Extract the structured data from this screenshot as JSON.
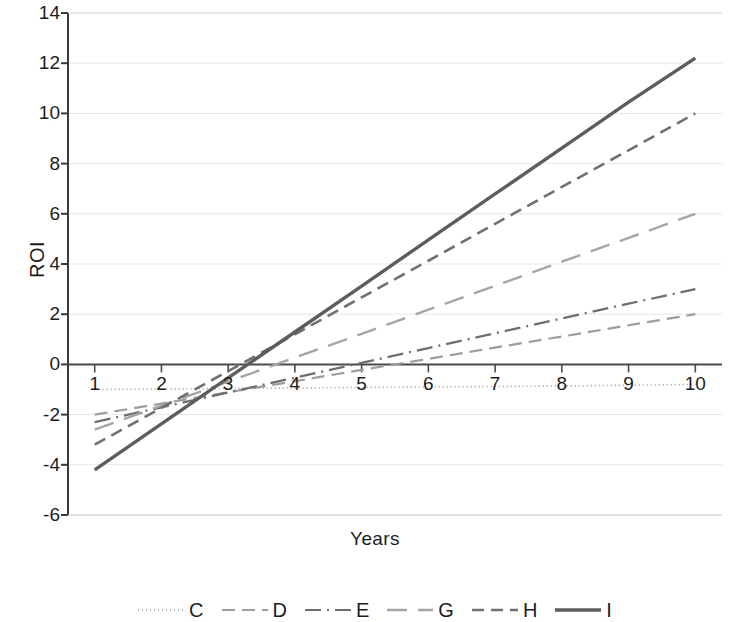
{
  "chart_data": {
    "type": "line",
    "title": "",
    "xlabel": "Years",
    "ylabel": "ROI",
    "x": [
      1,
      2,
      3,
      4,
      5,
      6,
      7,
      8,
      9,
      10
    ],
    "xlim": [
      0.6,
      10.4
    ],
    "ylim": [
      -6,
      14
    ],
    "xticks": [
      "1",
      "2",
      "3",
      "4",
      "5",
      "6",
      "7",
      "8",
      "9",
      "10"
    ],
    "yticks": [
      "14",
      "12",
      "10",
      "8",
      "6",
      "4",
      "2",
      "0",
      "-2",
      "-4",
      "-6"
    ],
    "grid": true,
    "grid_axis": "y",
    "zero_line": true,
    "legend_position": "bottom",
    "series": [
      {
        "name": "C",
        "style": "dotted",
        "color": "#9a9a9a",
        "width": 1.6,
        "dash": "1,3",
        "values": [
          -1.0,
          -0.98,
          -0.96,
          -0.94,
          -0.92,
          -0.9,
          -0.88,
          -0.86,
          -0.83,
          -0.8
        ]
      },
      {
        "name": "D",
        "style": "dashed",
        "color": "#9d9d9d",
        "width": 2.2,
        "dash": "13,7",
        "values": [
          -2.0,
          -1.56,
          -1.11,
          -0.67,
          -0.22,
          0.22,
          0.67,
          1.11,
          1.56,
          2.0
        ]
      },
      {
        "name": "E",
        "style": "dash-dot",
        "color": "#6e6e6e",
        "width": 2.2,
        "dash": "16,6,2,6",
        "values": [
          -2.3,
          -1.71,
          -1.12,
          -0.53,
          0.06,
          0.65,
          1.24,
          1.83,
          2.42,
          3.0
        ]
      },
      {
        "name": "G",
        "style": "long-dash",
        "color": "#a5a5a5",
        "width": 2.4,
        "dash": "20,11",
        "values": [
          -2.6,
          -1.64,
          -0.69,
          0.27,
          1.22,
          2.18,
          3.13,
          4.09,
          5.04,
          6.0
        ]
      },
      {
        "name": "H",
        "style": "medium-dash",
        "color": "#707070",
        "width": 2.6,
        "dash": "12,7",
        "values": [
          -3.2,
          -1.73,
          -0.27,
          1.2,
          2.67,
          4.13,
          5.6,
          7.07,
          8.53,
          10.0
        ]
      },
      {
        "name": "I",
        "style": "solid",
        "color": "#5d5d5d",
        "width": 3.4,
        "dash": "none",
        "values": [
          -4.2,
          -2.37,
          -0.54,
          1.29,
          3.12,
          4.96,
          6.79,
          8.62,
          10.45,
          12.2
        ]
      }
    ]
  },
  "axis": {
    "y_title": "ROI",
    "x_title": "Years"
  },
  "legend": {
    "items": [
      {
        "label": "C"
      },
      {
        "label": "D"
      },
      {
        "label": "E"
      },
      {
        "label": "G"
      },
      {
        "label": "H"
      },
      {
        "label": "I"
      }
    ]
  }
}
